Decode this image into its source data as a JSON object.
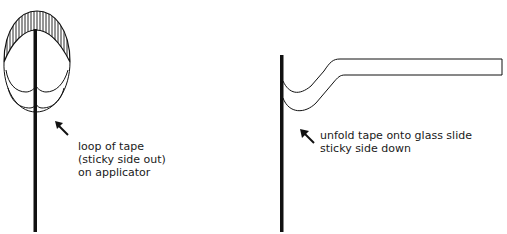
{
  "left_panel": {
    "caption": {
      "line1": "loop of tape",
      "line2": "(sticky side out)",
      "line3": "on applicator"
    }
  },
  "right_panel": {
    "caption": {
      "line1": "unfold tape onto glass slide",
      "line2": "sticky side down"
    }
  },
  "colors": {
    "ink": "#111111",
    "background": "#ffffff"
  }
}
